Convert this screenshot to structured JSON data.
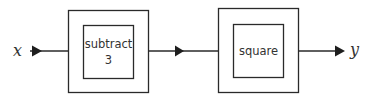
{
  "diagram": {
    "type": "block-diagram",
    "input": {
      "label": "x"
    },
    "output": {
      "label": "y"
    },
    "blocks": [
      {
        "label_line1": "subtract",
        "label_line2": "3"
      },
      {
        "label_line1": "square"
      }
    ],
    "colors": {
      "line": "#2a2a2a",
      "text": "#333333",
      "background": "#ffffff"
    }
  }
}
